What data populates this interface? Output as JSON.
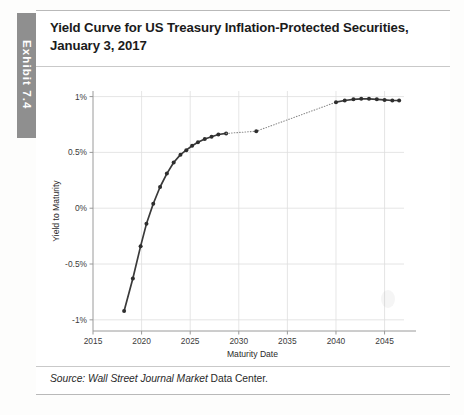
{
  "exhibit": {
    "tab_label": "Exhibit 7.4"
  },
  "title": {
    "line1": "Yield Curve for US Treasury Inflation-Protected Securities,",
    "line2": "January 3, 2017"
  },
  "source": {
    "prefix": "Source:",
    "italic_part": "Wall Street Journal Market",
    "roman_part": "Data Center."
  },
  "chart_data": {
    "type": "line",
    "title": "Yield Curve for US Treasury Inflation-Protected Securities, January 3, 2017",
    "xlabel": "Maturity Date",
    "ylabel": "Yield to Maturity",
    "xlim": [
      2015,
      2047
    ],
    "ylim": [
      -1.1,
      1.05
    ],
    "xticks": [
      2015,
      2020,
      2025,
      2030,
      2035,
      2040,
      2045
    ],
    "xtick_labels": [
      "2015",
      "2020",
      "2025",
      "2030",
      "2035",
      "2040",
      "2045"
    ],
    "yticks": [
      -1,
      -0.5,
      0,
      0.5,
      1
    ],
    "ytick_labels": [
      "-1%",
      "-0.5%",
      "0%",
      "0.5%",
      "1%"
    ],
    "grid": true,
    "grid_color": "#dedede",
    "line_color": "#3a3a3a",
    "marker_color": "#2e2e2e",
    "series": [
      {
        "name": "Short-to-intermediate TIPS",
        "style": "solid",
        "x": [
          2018.2,
          2019.1,
          2019.9,
          2020.5,
          2021.2,
          2021.9,
          2022.6,
          2023.3,
          2024.0,
          2024.6,
          2025.2,
          2025.8,
          2026.5,
          2027.2,
          2027.9,
          2028.7
        ],
        "y": [
          -0.92,
          -0.63,
          -0.34,
          -0.14,
          0.04,
          0.19,
          0.31,
          0.41,
          0.48,
          0.52,
          0.56,
          0.59,
          0.62,
          0.64,
          0.66,
          0.67
        ]
      },
      {
        "name": "Gap interpolation",
        "style": "dotted",
        "x": [
          2028.7,
          2031.8,
          2040.0
        ],
        "y": [
          0.67,
          0.69,
          0.95
        ]
      },
      {
        "name": "Isolated 2032 maturity",
        "style": "marker-only",
        "x": [
          2031.8
        ],
        "y": [
          0.69
        ]
      },
      {
        "name": "Long TIPS",
        "style": "solid",
        "x": [
          2040.0,
          2040.9,
          2041.8,
          2042.6,
          2043.4,
          2044.2,
          2045.0,
          2045.8,
          2046.5
        ],
        "y": [
          0.95,
          0.965,
          0.975,
          0.98,
          0.98,
          0.975,
          0.97,
          0.965,
          0.965
        ]
      }
    ]
  }
}
